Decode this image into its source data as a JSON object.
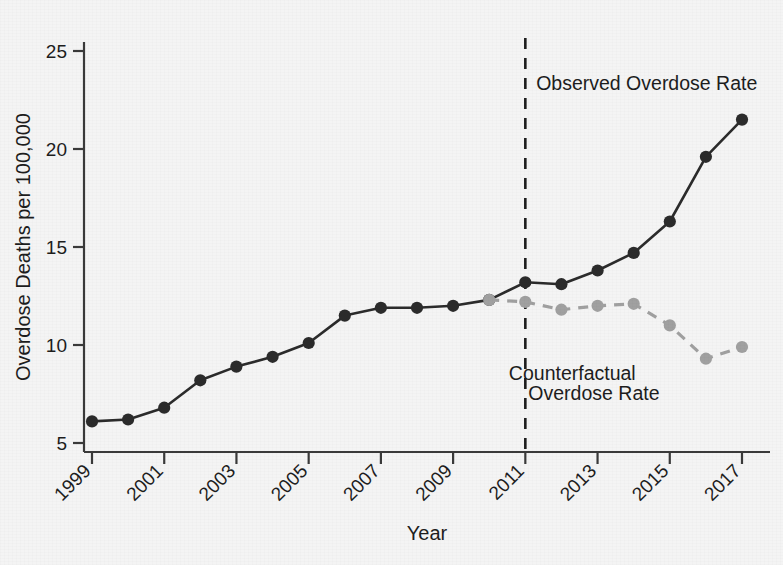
{
  "chart_data": {
    "type": "line",
    "title": "",
    "xlabel": "Year",
    "ylabel": "Overdose Deaths per 100,000",
    "xlim": [
      1998.6,
      2017.6
    ],
    "ylim": [
      4.4,
      25.8
    ],
    "yticks": [
      5,
      10,
      15,
      20,
      25
    ],
    "ytick_labels": [
      "5",
      "10",
      "15",
      "20",
      "25"
    ],
    "xticks": [
      1999,
      2001,
      2003,
      2005,
      2007,
      2009,
      2011,
      2013,
      2015,
      2017
    ],
    "xtick_labels": [
      "1999",
      "2001",
      "2003",
      "2005",
      "2007",
      "2009",
      "2011",
      "2013",
      "2015",
      "2017"
    ],
    "xtick_rotation": -45,
    "grid": false,
    "legend": "annotations",
    "series": [
      {
        "name": "Observed Overdose Rate",
        "style": "solid",
        "color": "#2b2b2b",
        "marker": "circle",
        "x": [
          1999,
          2000,
          2001,
          2002,
          2003,
          2004,
          2005,
          2006,
          2007,
          2008,
          2009,
          2010,
          2011,
          2012,
          2013,
          2014,
          2015,
          2016,
          2017
        ],
        "values": [
          6.1,
          6.2,
          6.8,
          8.2,
          8.9,
          9.4,
          10.1,
          11.5,
          11.9,
          11.9,
          12.0,
          12.3,
          13.2,
          13.1,
          13.8,
          14.7,
          16.3,
          19.6,
          21.5
        ]
      },
      {
        "name": "Counterfactual Overdose Rate",
        "style": "dashed",
        "color": "#a0a0a0",
        "marker": "circle",
        "x": [
          2010,
          2011,
          2012,
          2013,
          2014,
          2015,
          2016,
          2017
        ],
        "values": [
          12.3,
          12.2,
          11.8,
          12.0,
          12.1,
          11.0,
          9.3,
          9.9
        ]
      }
    ],
    "vline": {
      "x": 2011,
      "style": "dashed",
      "color": "#1d1d1d",
      "label": ""
    },
    "annotations": [
      {
        "text": "Observed Overdose Rate",
        "x": 2011.3,
        "y": 23.0,
        "anchor": "start",
        "color": "#1d1d1d"
      },
      {
        "text": "Counterfactual",
        "x": 2012.3,
        "y": 8.2,
        "anchor": "middle",
        "color": "#1d1d1d"
      },
      {
        "text": "Overdose Rate",
        "x": 2012.9,
        "y": 7.2,
        "anchor": "middle",
        "color": "#1d1d1d"
      }
    ]
  },
  "axes": {
    "x_title": "Year",
    "y_title": "Overdose Deaths per 100,000"
  },
  "colors": {
    "background": "#f4f4f4",
    "observed": "#2b2b2b",
    "counterfactual": "#a0a0a0",
    "axis": "#3a3a3a",
    "text": "#1d1d1d"
  }
}
